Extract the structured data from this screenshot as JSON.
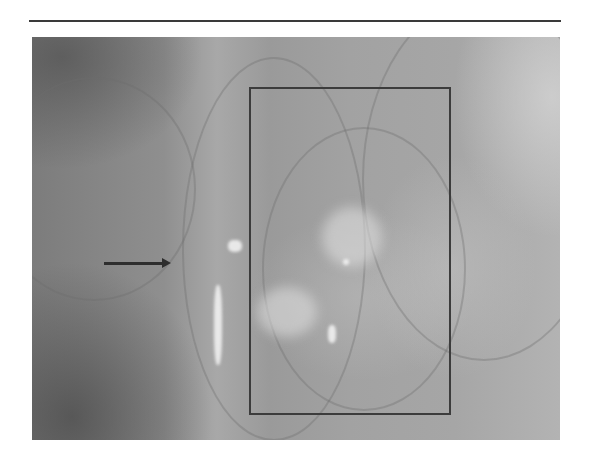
{
  "figure": {
    "type": "grayscale endoscopic photograph",
    "rule_color": "#3a3a3a",
    "annotations": {
      "roi_box": {
        "left": 250,
        "top": 88,
        "right": 450,
        "bottom": 414,
        "color": "#3c3c3c"
      },
      "arrow": {
        "from_x": 104,
        "to_x": 170,
        "y": 263,
        "direction": "right",
        "color": "#2e2e2e"
      }
    }
  }
}
